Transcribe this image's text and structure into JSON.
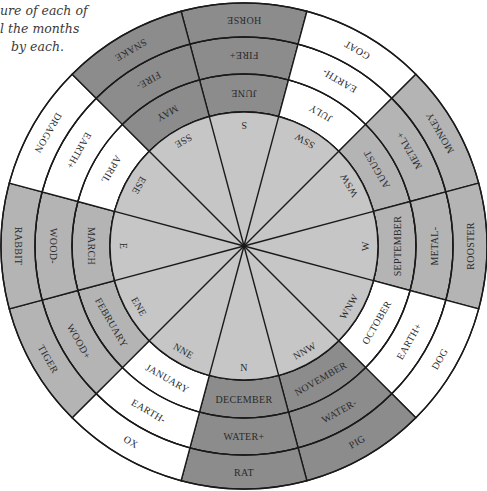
{
  "caption": {
    "lines": [
      "ure of each of",
      "l the months",
      "by each."
    ]
  },
  "colors": {
    "dark": "#8c8c8c",
    "medium": "#b4b4b4",
    "white": "#ffffff",
    "inner": "#c6c6c6",
    "line": "#1a1a1a"
  },
  "geometry": {
    "cx": 244,
    "cy": 246,
    "r_outer": 243,
    "r_element": 209,
    "r_month": 172,
    "r_inner": 134
  },
  "segments": [
    {
      "direction": "S",
      "month": "JUNE",
      "element": "FIRE+",
      "animal": "HORSE",
      "tone": "dark"
    },
    {
      "direction": "SSW",
      "month": "JULY",
      "element": "EARTH-",
      "animal": "GOAT",
      "tone": "white"
    },
    {
      "direction": "WSW",
      "month": "AUGUST",
      "element": "METAL+",
      "animal": "MONKEY",
      "tone": "medium"
    },
    {
      "direction": "W",
      "month": "SEPTEMBER",
      "element": "METAL-",
      "animal": "ROOSTER",
      "tone": "medium"
    },
    {
      "direction": "WNW",
      "month": "OCTOBER",
      "element": "EARTH+",
      "animal": "DOG",
      "tone": "white"
    },
    {
      "direction": "NNW",
      "month": "NOVEMBER",
      "element": "WATER-",
      "animal": "PIG",
      "tone": "dark"
    },
    {
      "direction": "N",
      "month": "DECEMBER",
      "element": "WATER+",
      "animal": "RAT",
      "tone": "dark"
    },
    {
      "direction": "NNE",
      "month": "JANUARY",
      "element": "EARTH-",
      "animal": "OX",
      "tone": "white"
    },
    {
      "direction": "ENE",
      "month": "FEBRUARY",
      "element": "WOOD+",
      "animal": "TIGER",
      "tone": "medium"
    },
    {
      "direction": "E",
      "month": "MARCH",
      "element": "WOOD-",
      "animal": "RABBIT",
      "tone": "medium"
    },
    {
      "direction": "ESE",
      "month": "APRIL",
      "element": "EARTH+",
      "animal": "DRAGON",
      "tone": "white"
    },
    {
      "direction": "SSE",
      "month": "MAY",
      "element": "FIRE-",
      "animal": "SNAKE",
      "tone": "dark"
    }
  ]
}
